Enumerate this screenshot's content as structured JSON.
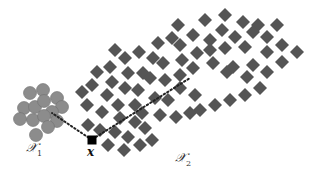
{
  "figure": {
    "labels": {
      "cluster1": "𝒳",
      "cluster1_sub": "1",
      "cluster2": "𝒳",
      "cluster2_sub": "2",
      "point": "x"
    },
    "colors": {
      "circle_fill": "#8c8c8c",
      "circle_stroke": "#707070",
      "diamond_fill": "#555555",
      "point_fill": "#000000",
      "dotted_line": "#222222"
    },
    "point": {
      "x": 92,
      "y": 140,
      "size": 9
    },
    "circle_radius": 6.5,
    "diamond_half": 7,
    "circles": [
      [
        30,
        93
      ],
      [
        43,
        90
      ],
      [
        57,
        98
      ],
      [
        24,
        108
      ],
      [
        35,
        107
      ],
      [
        44,
        101
      ],
      [
        62,
        107
      ],
      [
        52,
        112
      ],
      [
        20,
        119
      ],
      [
        33,
        120
      ],
      [
        44,
        116
      ],
      [
        57,
        121
      ],
      [
        48,
        127
      ],
      [
        36,
        135
      ]
    ],
    "diamonds": [
      [
        115,
        50
      ],
      [
        125,
        58
      ],
      [
        139,
        52
      ],
      [
        110,
        67
      ],
      [
        97,
        72
      ],
      [
        128,
        73
      ],
      [
        143,
        73
      ],
      [
        112,
        82
      ],
      [
        92,
        85
      ],
      [
        82,
        92
      ],
      [
        125,
        88
      ],
      [
        138,
        90
      ],
      [
        107,
        95
      ],
      [
        87,
        105
      ],
      [
        118,
        105
      ],
      [
        135,
        105
      ],
      [
        102,
        112
      ],
      [
        153,
        58
      ],
      [
        205,
        20
      ],
      [
        178,
        25
      ],
      [
        222,
        30
      ],
      [
        193,
        35
      ],
      [
        172,
        38
      ],
      [
        180,
        45
      ],
      [
        210,
        40
      ],
      [
        158,
        43
      ],
      [
        197,
        53
      ],
      [
        210,
        50
      ],
      [
        182,
        60
      ],
      [
        163,
        63
      ],
      [
        213,
        63
      ],
      [
        193,
        68
      ],
      [
        227,
        72
      ],
      [
        225,
        15
      ],
      [
        243,
        22
      ],
      [
        258,
        25
      ],
      [
        277,
        25
      ],
      [
        235,
        37
      ],
      [
        253,
        32
      ],
      [
        267,
        37
      ],
      [
        282,
        45
      ],
      [
        297,
        52
      ],
      [
        225,
        48
      ],
      [
        245,
        47
      ],
      [
        267,
        52
      ],
      [
        282,
        62
      ],
      [
        233,
        67
      ],
      [
        253,
        65
      ],
      [
        267,
        72
      ],
      [
        247,
        77
      ],
      [
        200,
        110
      ],
      [
        215,
        105
      ],
      [
        230,
        100
      ],
      [
        245,
        95
      ],
      [
        260,
        88
      ],
      [
        195,
        95
      ],
      [
        180,
        88
      ],
      [
        168,
        100
      ],
      [
        155,
        98
      ],
      [
        160,
        115
      ],
      [
        142,
        113
      ],
      [
        176,
        117
      ],
      [
        190,
        113
      ],
      [
        120,
        118
      ],
      [
        135,
        122
      ],
      [
        115,
        132
      ],
      [
        128,
        137
      ],
      [
        100,
        130
      ],
      [
        145,
        128
      ],
      [
        140,
        145
      ],
      [
        124,
        150
      ],
      [
        108,
        145
      ],
      [
        150,
        78
      ],
      [
        165,
        80
      ],
      [
        180,
        75
      ],
      [
        88,
        125
      ],
      [
        152,
        140
      ]
    ],
    "dotted_lines": [
      {
        "from": [
          92,
          140
        ],
        "to": [
          52,
          113
        ]
      },
      {
        "from": [
          96,
          137
        ],
        "to": [
          190,
          78
        ]
      }
    ]
  }
}
